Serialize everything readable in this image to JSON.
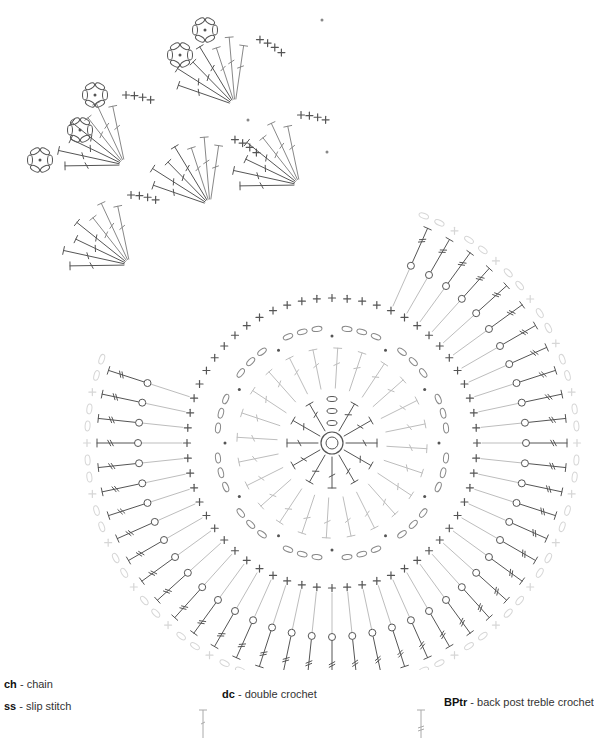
{
  "diagram": {
    "center": {
      "x": 332,
      "y": 443
    },
    "colors": {
      "dark": "#555555",
      "mid": "#888888",
      "light": "#bdbdbd",
      "faint": "#d6d6d6"
    },
    "rounds": [
      {
        "round": 1,
        "stitch": "dc",
        "count": 12,
        "radius_in": 14,
        "radius_out": 45,
        "tone": "dark"
      },
      {
        "round": 2,
        "stitch": "dc-v",
        "count": 24,
        "radius_in": 55,
        "radius_out": 95,
        "tone": "light"
      },
      {
        "round": 3,
        "stitch": "ch-sc",
        "count": 48,
        "radius": 115,
        "tone": "dark"
      },
      {
        "round": 4,
        "stitch": "sc",
        "count": 60,
        "radius": 145,
        "tone": "dark"
      },
      {
        "round": 5,
        "stitch": "BPtr",
        "count": 60,
        "radius_in": 150,
        "radius_out": 235,
        "tone": "dark"
      },
      {
        "round": 6,
        "stitch": "ch-sc",
        "count": 60,
        "radius": 245,
        "tone": "faint"
      }
    ],
    "petals": [
      {
        "x": 130,
        "y": 265
      },
      {
        "x": 210,
        "y": 205
      },
      {
        "x": 300,
        "y": 185
      },
      {
        "x": 235,
        "y": 105
      },
      {
        "x": 125,
        "y": 165
      }
    ]
  },
  "legend": {
    "items": [
      {
        "abbr": "ch",
        "separator": " - ",
        "name": "chain"
      },
      {
        "abbr": "ss",
        "separator": " - ",
        "name": "slip stitch"
      },
      {
        "abbr": "dc",
        "separator": " - ",
        "name": "double crochet"
      },
      {
        "abbr": "BPtr",
        "separator": " - ",
        "name": "back post treble crochet"
      }
    ]
  }
}
